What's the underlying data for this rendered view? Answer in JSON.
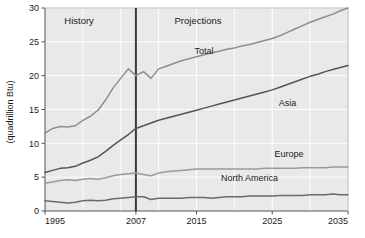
{
  "chart_data": {
    "type": "line",
    "title": "",
    "xlabel": "",
    "ylabel": "(quadrillion Btu)",
    "xlim": [
      1995,
      2035
    ],
    "ylim": [
      0,
      30
    ],
    "grid": true,
    "legend_position": "inline-annotations",
    "xticks": [
      1995,
      2007,
      2015,
      2025,
      2035
    ],
    "xtick_labels": [
      "1995",
      "2007",
      "2015",
      "2025",
      "2035"
    ],
    "yticks": [
      0,
      5,
      10,
      15,
      20,
      25,
      30
    ],
    "ytick_labels": [
      "0",
      "5",
      "10",
      "15",
      "20",
      "25",
      "30"
    ],
    "annotations": [
      {
        "name": "history-label",
        "text": "History",
        "x": 1999.5,
        "y": 27.6
      },
      {
        "name": "projections-label",
        "text": "Projections",
        "x": 2015.2,
        "y": 27.6
      },
      {
        "name": "divider-year",
        "text": "2007",
        "x": 2007,
        "y": 0
      }
    ],
    "divider_x": 2007,
    "series": [
      {
        "name": "Total",
        "label": "Total",
        "color": "#8e8e8e",
        "label_x": 2016.0,
        "label_y": 23.2,
        "x": [
          1995,
          1996,
          1997,
          1998,
          1999,
          2000,
          2001,
          2002,
          2003,
          2004,
          2005,
          2006,
          2007,
          2008,
          2009,
          2010,
          2011,
          2012,
          2013,
          2014,
          2015,
          2016,
          2017,
          2018,
          2019,
          2020,
          2021,
          2022,
          2023,
          2024,
          2025,
          2026,
          2027,
          2028,
          2029,
          2030,
          2031,
          2032,
          2033,
          2034,
          2035
        ],
        "y": [
          11.5,
          12.2,
          12.5,
          12.4,
          12.6,
          13.4,
          14.0,
          14.9,
          16.4,
          18.2,
          19.6,
          21.0,
          20.0,
          20.6,
          19.6,
          21.0,
          21.4,
          21.8,
          22.2,
          22.5,
          22.8,
          23.1,
          23.4,
          23.6,
          23.9,
          24.1,
          24.4,
          24.6,
          24.9,
          25.2,
          25.5,
          25.9,
          26.4,
          26.9,
          27.4,
          27.9,
          28.3,
          28.7,
          29.1,
          29.6,
          30.0
        ]
      },
      {
        "name": "Asia",
        "label": "Asia",
        "color": "#555555",
        "label_x": 2027.0,
        "label_y": 15.5,
        "x": [
          1995,
          1996,
          1997,
          1998,
          1999,
          2000,
          2001,
          2002,
          2003,
          2004,
          2005,
          2006,
          2007,
          2008,
          2009,
          2010,
          2011,
          2012,
          2013,
          2014,
          2015,
          2016,
          2017,
          2018,
          2019,
          2020,
          2021,
          2022,
          2023,
          2024,
          2025,
          2026,
          2027,
          2028,
          2029,
          2030,
          2031,
          2032,
          2033,
          2034,
          2035
        ],
        "y": [
          5.7,
          6.0,
          6.3,
          6.4,
          6.6,
          7.1,
          7.5,
          8.0,
          8.8,
          9.7,
          10.5,
          11.3,
          12.2,
          12.6,
          13.0,
          13.4,
          13.7,
          14.0,
          14.3,
          14.6,
          14.9,
          15.2,
          15.5,
          15.8,
          16.1,
          16.4,
          16.7,
          17.0,
          17.3,
          17.6,
          17.9,
          18.3,
          18.7,
          19.1,
          19.5,
          19.9,
          20.2,
          20.6,
          20.9,
          21.2,
          21.5
        ]
      },
      {
        "name": "Europe",
        "label": "Europe",
        "color": "#9a9a9a",
        "label_x": 2027.2,
        "label_y": 8.0,
        "x": [
          1995,
          1996,
          1997,
          1998,
          1999,
          2000,
          2001,
          2002,
          2003,
          2004,
          2005,
          2006,
          2007,
          2008,
          2009,
          2010,
          2011,
          2012,
          2013,
          2014,
          2015,
          2016,
          2017,
          2018,
          2019,
          2020,
          2021,
          2022,
          2023,
          2024,
          2025,
          2026,
          2027,
          2028,
          2029,
          2030,
          2031,
          2032,
          2033,
          2034,
          2035
        ],
        "y": [
          4.1,
          4.3,
          4.5,
          4.6,
          4.5,
          4.7,
          4.8,
          4.7,
          4.9,
          5.2,
          5.4,
          5.5,
          5.6,
          5.4,
          5.2,
          5.6,
          5.8,
          5.9,
          6.0,
          6.1,
          6.2,
          6.2,
          6.2,
          6.2,
          6.2,
          6.2,
          6.2,
          6.2,
          6.2,
          6.3,
          6.3,
          6.3,
          6.3,
          6.3,
          6.4,
          6.4,
          6.4,
          6.4,
          6.5,
          6.5,
          6.5
        ]
      },
      {
        "name": "North America",
        "label": "North America",
        "color": "#6b6b6b",
        "label_x": 2022.0,
        "label_y": 4.5,
        "x": [
          1995,
          1996,
          1997,
          1998,
          1999,
          2000,
          2001,
          2002,
          2003,
          2004,
          2005,
          2006,
          2007,
          2008,
          2009,
          2010,
          2011,
          2012,
          2013,
          2014,
          2015,
          2016,
          2017,
          2018,
          2019,
          2020,
          2021,
          2022,
          2023,
          2024,
          2025,
          2026,
          2027,
          2028,
          2029,
          2030,
          2031,
          2032,
          2033,
          2034,
          2035
        ],
        "y": [
          1.5,
          1.4,
          1.3,
          1.2,
          1.3,
          1.5,
          1.6,
          1.5,
          1.6,
          1.8,
          1.9,
          2.0,
          2.1,
          2.1,
          1.7,
          1.9,
          1.9,
          1.9,
          1.9,
          2.0,
          2.0,
          2.0,
          1.9,
          2.0,
          2.1,
          2.1,
          2.1,
          2.2,
          2.2,
          2.2,
          2.2,
          2.3,
          2.3,
          2.3,
          2.3,
          2.4,
          2.4,
          2.4,
          2.5,
          2.4,
          2.4
        ]
      }
    ]
  },
  "axis": {
    "y_title": "(quadrillion Btu)"
  }
}
